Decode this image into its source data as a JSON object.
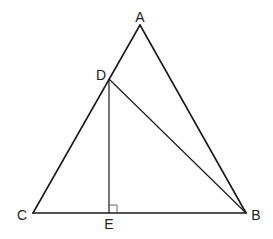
{
  "diagram": {
    "type": "geometry",
    "points": {
      "A": {
        "label": "A",
        "x": 140,
        "y": 25,
        "lx": 140,
        "ly": 22
      },
      "B": {
        "label": "B",
        "x": 246,
        "y": 213,
        "lx": 256,
        "ly": 220
      },
      "C": {
        "label": "C",
        "x": 33,
        "y": 213,
        "lx": 22,
        "ly": 220
      },
      "D": {
        "label": "D",
        "x": 109,
        "y": 79,
        "lx": 101,
        "ly": 80
      },
      "E": {
        "label": "E",
        "x": 109,
        "y": 213,
        "lx": 109,
        "ly": 229
      }
    },
    "segments": [
      "AB",
      "AC",
      "BC",
      "DB",
      "DE"
    ],
    "right_angle": {
      "vertex": "E",
      "between": [
        "D",
        "B"
      ]
    }
  }
}
